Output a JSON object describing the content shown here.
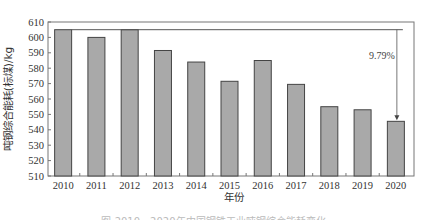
{
  "chart_data": {
    "type": "bar",
    "title": "",
    "xlabel": "年份",
    "ylabel": "吨钢综合能耗(标煤)/kg",
    "categories": [
      "2010",
      "2011",
      "2012",
      "2013",
      "2014",
      "2015",
      "2016",
      "2017",
      "2018",
      "2019",
      "2020"
    ],
    "values": [
      605,
      600,
      605,
      591.5,
      584,
      571.5,
      585,
      569.5,
      555,
      553,
      545.5
    ],
    "ylim": [
      510,
      610
    ],
    "yticks": [
      510,
      520,
      530,
      540,
      550,
      560,
      570,
      580,
      590,
      600,
      610
    ],
    "grid": false,
    "legend": null,
    "bar_color": "#a9a9a9",
    "bar_edge_color": "#444444",
    "annotations": [
      {
        "text": "9.79%",
        "type": "arrow",
        "from_category": "2010",
        "to_category": "2020",
        "description": "decrease from 2010 to 2020"
      }
    ]
  },
  "caption": "图  2010—2020年中国钢铁工业吨钢综合能耗变化"
}
